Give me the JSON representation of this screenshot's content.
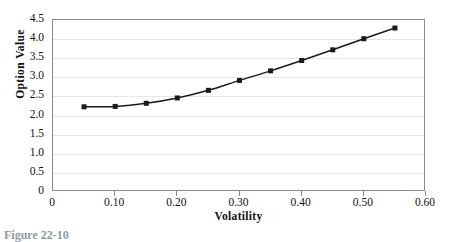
{
  "chart_data": {
    "type": "line",
    "title": "",
    "xlabel": "Volatility",
    "ylabel": "Option Value",
    "x": [
      0.05,
      0.1,
      0.15,
      0.2,
      0.25,
      0.3,
      0.35,
      0.4,
      0.45,
      0.5,
      0.55
    ],
    "values": [
      2.23,
      2.24,
      2.32,
      2.46,
      2.66,
      2.92,
      3.17,
      3.44,
      3.72,
      4.01,
      4.29
    ],
    "series": [
      {
        "name": "Option Value",
        "values": [
          2.23,
          2.24,
          2.32,
          2.46,
          2.66,
          2.92,
          3.17,
          3.44,
          3.72,
          4.01,
          4.29
        ]
      }
    ],
    "xlim": [
      0,
      0.6
    ],
    "ylim": [
      0,
      4.5
    ],
    "x_ticks": [
      0,
      0.1,
      0.2,
      0.3,
      0.4,
      0.5,
      0.6
    ],
    "x_tick_labels": [
      "0",
      "0.10",
      "0.20",
      "0.30",
      "0.40",
      "0.50",
      "0.60"
    ],
    "y_ticks": [
      0,
      0.5,
      1.0,
      1.5,
      2.0,
      2.5,
      3.0,
      3.5,
      4.0,
      4.5
    ],
    "y_tick_labels": [
      "0",
      "0.5",
      "1.0",
      "1.5",
      "2.0",
      "2.5",
      "3.0",
      "3.5",
      "4.0",
      "4.5"
    ],
    "grid": "horizontal",
    "legend": "none",
    "marker": "square",
    "line_color": "#1a1a1a",
    "marker_color": "#1a1a1a",
    "grid_color": "#e6e6e6",
    "frame_color": "#8a8a8a"
  },
  "caption": {
    "text": "Figure 22-10"
  }
}
